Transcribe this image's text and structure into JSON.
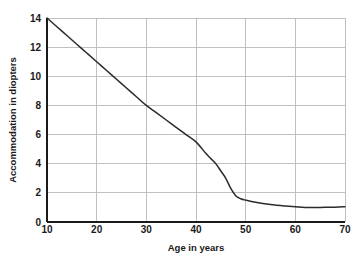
{
  "chart_data": {
    "type": "line",
    "title": "",
    "xlabel": "Age in years",
    "ylabel": "Accommodation in diopters",
    "xlim": [
      10,
      70
    ],
    "ylim": [
      0,
      14
    ],
    "xticks": [
      10,
      20,
      30,
      40,
      50,
      60,
      70
    ],
    "yticks": [
      0,
      2,
      4,
      6,
      8,
      10,
      12,
      14
    ],
    "xtick_labels": [
      "10",
      "20",
      "30",
      "40",
      "50",
      "60",
      "70"
    ],
    "ytick_labels": [
      "0",
      "2",
      "4",
      "6",
      "8",
      "10",
      "12",
      "14"
    ],
    "grid": true,
    "legend": false,
    "series": [
      {
        "name": "Amplitude of accommodation",
        "color": "#2b2b2b",
        "x": [
          10,
          12,
          14,
          16,
          18,
          20,
          22,
          24,
          26,
          28,
          30,
          32,
          34,
          36,
          38,
          40,
          42,
          43,
          44,
          45,
          46,
          47,
          48,
          49,
          50,
          52,
          55,
          58,
          60,
          62,
          65,
          68,
          70
        ],
        "y": [
          14.0,
          13.4,
          12.8,
          12.2,
          11.6,
          11.0,
          10.4,
          9.8,
          9.2,
          8.6,
          8.0,
          7.5,
          7.0,
          6.5,
          6.0,
          5.5,
          4.7,
          4.35,
          4.0,
          3.5,
          3.0,
          2.3,
          1.8,
          1.6,
          1.5,
          1.35,
          1.2,
          1.1,
          1.05,
          1.0,
          1.0,
          1.02,
          1.05
        ]
      }
    ]
  }
}
